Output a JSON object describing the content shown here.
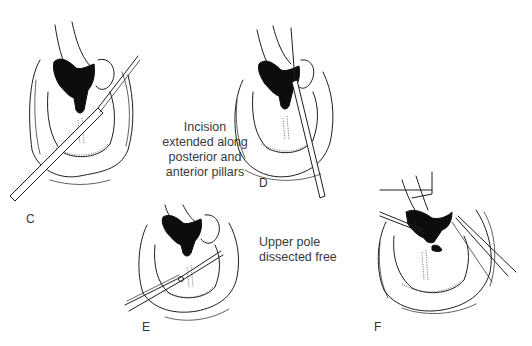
{
  "figure": {
    "panels": [
      {
        "id": "C",
        "label": "C"
      },
      {
        "id": "D",
        "label": "D"
      },
      {
        "id": "E",
        "label": "E"
      },
      {
        "id": "F",
        "label": "F"
      }
    ],
    "captions": {
      "incision": {
        "lines": [
          "Incision",
          "extended along",
          "posterior and",
          "anterior pillars"
        ]
      },
      "upper_pole": {
        "lines": [
          "Upper pole",
          "dissected free"
        ]
      }
    },
    "colors": {
      "background": "#ffffff",
      "line": "#1e1e1e",
      "text": "#3a3a3a"
    }
  }
}
